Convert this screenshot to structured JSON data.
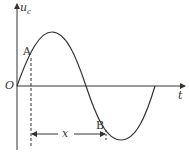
{
  "diagram": {
    "type": "waveform",
    "y_axis_label": "u",
    "y_axis_subscript": "c",
    "x_axis_label": "t",
    "origin_label": "O",
    "point_a_label": "A",
    "point_b_label": "B",
    "distance_label": "x",
    "colors": {
      "line": "#333333",
      "background": "#ffffff"
    }
  }
}
